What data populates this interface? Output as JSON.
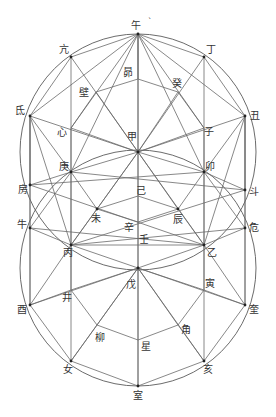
{
  "title": "",
  "diagram": {
    "type": "two overlapping circles with inscribed star-polygon constructions",
    "circles": [
      {
        "name": "upper-circle",
        "cx": 138,
        "cy": 152,
        "r": 118
      },
      {
        "name": "lower-circle",
        "cx": 138,
        "cy": 268,
        "r": 118
      }
    ],
    "nodes": {
      "wu": {
        "label": "午",
        "x": 138,
        "y": 34,
        "lx": 136,
        "ly": 26
      },
      "kang": {
        "label": "亢",
        "x": 71,
        "y": 57,
        "lx": 64,
        "ly": 50
      },
      "ding": {
        "label": "丁",
        "x": 204,
        "y": 57,
        "lx": 211,
        "ly": 50
      },
      "di": {
        "label": "氐",
        "x": 30,
        "y": 116,
        "lx": 20,
        "ly": 111
      },
      "chou": {
        "label": "丑",
        "x": 245,
        "y": 116,
        "lx": 255,
        "ly": 116
      },
      "mao_top": {
        "label": "昴",
        "x": 138,
        "y": 79,
        "lx": 128,
        "ly": 73
      },
      "bi": {
        "label": "壁",
        "x": 96,
        "y": 92,
        "lx": 84,
        "ly": 93
      },
      "gui": {
        "label": "癸",
        "x": 178,
        "y": 92,
        "lx": 177,
        "ly": 84
      },
      "xin": {
        "label": "心",
        "x": 71,
        "y": 128,
        "lx": 62,
        "ly": 133
      },
      "jia": {
        "label": "甲",
        "x": 138,
        "y": 152,
        "lx": 132,
        "ly": 137
      },
      "zi": {
        "label": "子",
        "x": 204,
        "y": 128,
        "lx": 209,
        "ly": 132
      },
      "geng": {
        "label": "庚",
        "x": 71,
        "y": 172,
        "lx": 64,
        "ly": 167
      },
      "mao": {
        "label": "卯",
        "x": 204,
        "y": 172,
        "lx": 210,
        "ly": 167
      },
      "fang": {
        "label": "房",
        "x": 30,
        "y": 185,
        "lx": 23,
        "ly": 190
      },
      "dou": {
        "label": "斗",
        "x": 245,
        "y": 190,
        "lx": 254,
        "ly": 192
      },
      "ji": {
        "label": "己",
        "x": 138,
        "y": 196,
        "lx": 141,
        "ly": 191
      },
      "wei": {
        "label": "未",
        "x": 97,
        "y": 209,
        "lx": 96,
        "ly": 219
      },
      "chen": {
        "label": "辰",
        "x": 178,
        "y": 209,
        "lx": 178,
        "ly": 220
      },
      "xin2": {
        "label": "辛",
        "x": 138,
        "y": 222,
        "lx": 129,
        "ly": 228
      },
      "niu": {
        "label": "牛",
        "x": 30,
        "y": 228,
        "lx": 22,
        "ly": 225
      },
      "wei2": {
        "label": "危",
        "x": 245,
        "y": 228,
        "lx": 254,
        "ly": 228
      },
      "ren": {
        "label": "壬",
        "x": 138,
        "y": 236,
        "lx": 144,
        "ly": 240
      },
      "bing": {
        "label": "丙",
        "x": 71,
        "y": 245,
        "lx": 68,
        "ly": 253
      },
      "yi": {
        "label": "乙",
        "x": 204,
        "y": 245,
        "lx": 212,
        "ly": 253
      },
      "wu2": {
        "label": "戊",
        "x": 138,
        "y": 268,
        "lx": 131,
        "ly": 285
      },
      "jing": {
        "label": "井",
        "x": 71,
        "y": 290,
        "lx": 67,
        "ly": 298
      },
      "yin": {
        "label": "寅",
        "x": 204,
        "y": 290,
        "lx": 210,
        "ly": 284
      },
      "you": {
        "label": "酉",
        "x": 30,
        "y": 305,
        "lx": 22,
        "ly": 310
      },
      "kui": {
        "label": "奎",
        "x": 245,
        "y": 305,
        "lx": 254,
        "ly": 310
      },
      "liu": {
        "label": "柳",
        "x": 97,
        "y": 325,
        "lx": 100,
        "ly": 338
      },
      "jiao": {
        "label": "角",
        "x": 178,
        "y": 325,
        "lx": 186,
        "ly": 330
      },
      "xing": {
        "label": "星",
        "x": 138,
        "y": 340,
        "lx": 146,
        "ly": 347
      },
      "nv": {
        "label": "女",
        "x": 71,
        "y": 361,
        "lx": 68,
        "ly": 370
      },
      "hai": {
        "label": "亥",
        "x": 204,
        "y": 361,
        "lx": 208,
        "ly": 370
      },
      "shi": {
        "label": "室",
        "x": 138,
        "y": 386,
        "lx": 138,
        "ly": 396
      }
    },
    "annotation_mark": {
      "label": "`",
      "x": 150,
      "y": 23
    },
    "edges": [
      [
        "wu",
        "kang"
      ],
      [
        "wu",
        "ding"
      ],
      [
        "wu",
        "di"
      ],
      [
        "wu",
        "chou"
      ],
      [
        "wu",
        "xin"
      ],
      [
        "wu",
        "zi"
      ],
      [
        "wu",
        "mao_top"
      ],
      [
        "wu",
        "jia"
      ],
      [
        "wu",
        "geng"
      ],
      [
        "wu",
        "mao"
      ],
      [
        "kang",
        "jia"
      ],
      [
        "ding",
        "jia"
      ],
      [
        "kang",
        "di"
      ],
      [
        "ding",
        "chou"
      ],
      [
        "di",
        "jia"
      ],
      [
        "chou",
        "jia"
      ],
      [
        "di",
        "geng"
      ],
      [
        "chou",
        "mao"
      ],
      [
        "di",
        "bing"
      ],
      [
        "chou",
        "yi"
      ],
      [
        "di",
        "fang"
      ],
      [
        "chou",
        "dou"
      ],
      [
        "mao_top",
        "bi"
      ],
      [
        "mao_top",
        "gui"
      ],
      [
        "bi",
        "xin"
      ],
      [
        "gui",
        "zi"
      ],
      [
        "bi",
        "jia"
      ],
      [
        "gui",
        "jia"
      ],
      [
        "xin",
        "jia"
      ],
      [
        "zi",
        "jia"
      ],
      [
        "xin",
        "geng"
      ],
      [
        "zi",
        "mao"
      ],
      [
        "geng",
        "jia"
      ],
      [
        "mao",
        "jia"
      ],
      [
        "jia",
        "bing"
      ],
      [
        "jia",
        "yi"
      ],
      [
        "jia",
        "wei"
      ],
      [
        "jia",
        "chen"
      ],
      [
        "jia",
        "wu2"
      ],
      [
        "geng",
        "wei"
      ],
      [
        "mao",
        "chen"
      ],
      [
        "geng",
        "bing"
      ],
      [
        "mao",
        "yi"
      ],
      [
        "wei",
        "ji"
      ],
      [
        "chen",
        "ji"
      ],
      [
        "wei",
        "xin2"
      ],
      [
        "chen",
        "xin2"
      ],
      [
        "wei",
        "bing"
      ],
      [
        "chen",
        "yi"
      ],
      [
        "bing",
        "yi"
      ],
      [
        "fang",
        "geng"
      ],
      [
        "fang",
        "yi"
      ],
      [
        "dou",
        "mao"
      ],
      [
        "dou",
        "bing"
      ],
      [
        "niu",
        "geng"
      ],
      [
        "niu",
        "bing"
      ],
      [
        "wei2",
        "mao"
      ],
      [
        "wei2",
        "yi"
      ],
      [
        "niu",
        "yi"
      ],
      [
        "wei2",
        "bing"
      ],
      [
        "fang",
        "mao"
      ],
      [
        "dou",
        "geng"
      ],
      [
        "bing",
        "wu2"
      ],
      [
        "yi",
        "wu2"
      ],
      [
        "bing",
        "jing"
      ],
      [
        "yi",
        "yin"
      ],
      [
        "wu2",
        "jing"
      ],
      [
        "wu2",
        "yin"
      ],
      [
        "wu2",
        "liu"
      ],
      [
        "wu2",
        "jiao"
      ],
      [
        "wu2",
        "shi"
      ],
      [
        "wu2",
        "nv"
      ],
      [
        "wu2",
        "hai"
      ],
      [
        "wu2",
        "you"
      ],
      [
        "wu2",
        "kui"
      ],
      [
        "jing",
        "you"
      ],
      [
        "yin",
        "kui"
      ],
      [
        "jing",
        "liu"
      ],
      [
        "yin",
        "jiao"
      ],
      [
        "liu",
        "xing"
      ],
      [
        "jiao",
        "xing"
      ],
      [
        "liu",
        "nv"
      ],
      [
        "jiao",
        "hai"
      ],
      [
        "you",
        "nv"
      ],
      [
        "kui",
        "hai"
      ],
      [
        "nv",
        "shi"
      ],
      [
        "hai",
        "shi"
      ],
      [
        "bing",
        "you"
      ],
      [
        "yi",
        "kui"
      ],
      [
        "niu",
        "you"
      ],
      [
        "wei2",
        "kui"
      ],
      [
        "di",
        "niu"
      ],
      [
        "chou",
        "wei2"
      ]
    ],
    "vertical_lines": [
      {
        "x": 30,
        "y1": 116,
        "y2": 305
      },
      {
        "x": 71,
        "y1": 57,
        "y2": 361
      },
      {
        "x": 138,
        "y1": 34,
        "y2": 386
      },
      {
        "x": 204,
        "y1": 57,
        "y2": 361
      },
      {
        "x": 245,
        "y1": 116,
        "y2": 305
      }
    ],
    "dots": [
      "wu",
      "jia",
      "bing",
      "yi",
      "wu2",
      "shi",
      "kang",
      "ding",
      "di",
      "chou",
      "geng",
      "mao",
      "wei",
      "chen",
      "niu",
      "wei2",
      "fang",
      "dou",
      "you",
      "kui",
      "nv",
      "hai"
    ]
  }
}
